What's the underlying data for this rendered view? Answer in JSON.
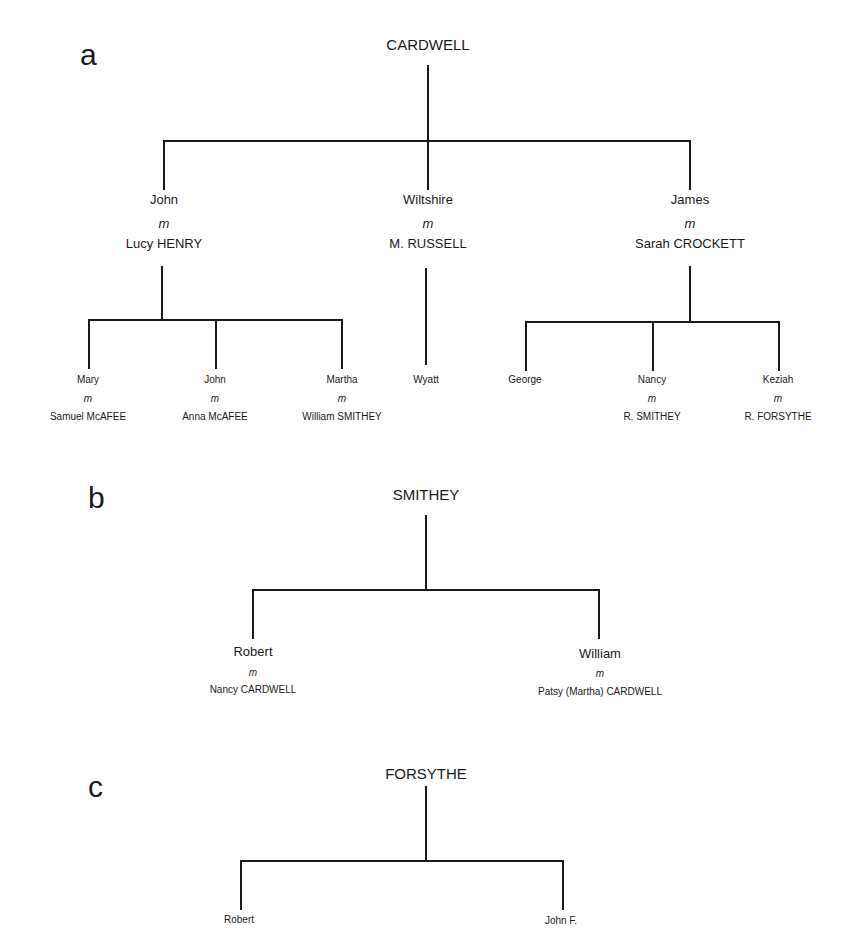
{
  "panels": {
    "a": {
      "label": "a",
      "root": "CARDWELL",
      "marriage_symbol": "m",
      "children": [
        {
          "name": "John",
          "spouse": "Lucy HENRY",
          "children": [
            {
              "name": "Mary",
              "spouse": "Samuel McAFEE"
            },
            {
              "name": "John",
              "spouse": "Anna McAFEE"
            },
            {
              "name": "Martha",
              "spouse": "William SMITHEY"
            }
          ]
        },
        {
          "name": "Wiltshire",
          "spouse": "M. RUSSELL",
          "children": [
            {
              "name": "Wyatt"
            }
          ]
        },
        {
          "name": "James",
          "spouse": "Sarah CROCKETT",
          "children": [
            {
              "name": "George"
            },
            {
              "name": "Nancy",
              "spouse": "R. SMITHEY"
            },
            {
              "name": "Keziah",
              "spouse": "R. FORSYTHE"
            }
          ]
        }
      ]
    },
    "b": {
      "label": "b",
      "root": "SMITHEY",
      "marriage_symbol": "m",
      "children": [
        {
          "name": "Robert",
          "spouse": "Nancy CARDWELL"
        },
        {
          "name": "William",
          "spouse": "Patsy (Martha) CARDWELL"
        }
      ]
    },
    "c": {
      "label": "c",
      "root": "FORSYTHE",
      "children": [
        {
          "name": "Robert"
        },
        {
          "name": "John F."
        }
      ]
    }
  }
}
